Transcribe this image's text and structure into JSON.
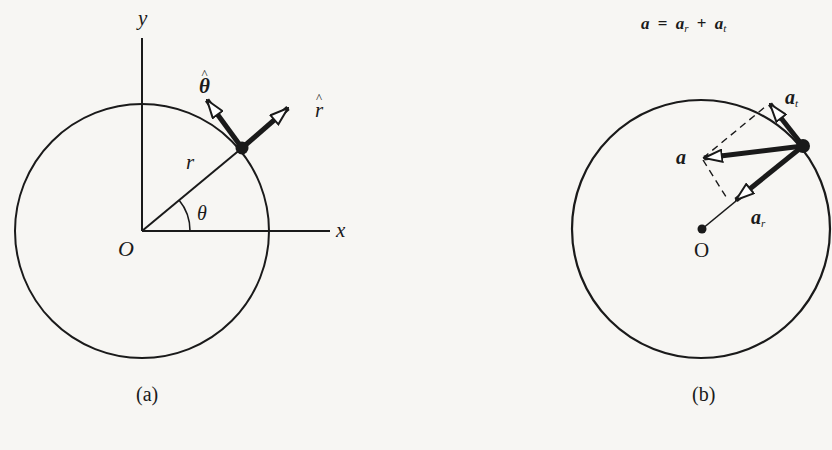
{
  "figure_a": {
    "caption": "(a)",
    "axis_y_label": "y",
    "axis_x_label": "x",
    "origin_label": "O",
    "radius_label": "r",
    "angle_label": "θ",
    "unit_theta_label": "θ",
    "unit_r_label": "r"
  },
  "figure_b": {
    "caption": "(b)",
    "equation": {
      "lhs": "a",
      "equals": "=",
      "term1": "a",
      "term1_sub": "r",
      "plus": "+",
      "term2": "a",
      "term2_sub": "t"
    },
    "center_label": "O",
    "accel_label": "a",
    "radial_label": "a",
    "radial_sub": "r",
    "tangential_label": "a",
    "tangential_sub": "t"
  },
  "colors": {
    "ink": "#1a1a1a",
    "paper": "#f7f6f3"
  }
}
